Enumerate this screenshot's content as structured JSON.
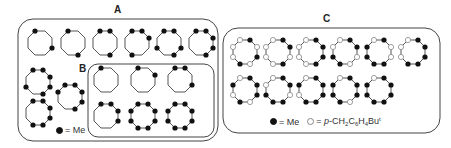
{
  "figure": {
    "panels": [
      {
        "id": "A",
        "label": "A"
      },
      {
        "id": "B",
        "label": "B"
      },
      {
        "id": "C",
        "label": "C"
      }
    ],
    "legend_A": {
      "filled_symbol": "●",
      "filled_text": "= Me"
    },
    "legend_C": {
      "filled_symbol": "●",
      "filled_text": "= Me",
      "open_symbol": "○",
      "open_text_prefix": "= ",
      "open_text_italic": "p",
      "open_text_rest": "-CH",
      "sub1": "2",
      "mid1": "C",
      "sub2": "6",
      "mid2": "H",
      "sub3": "4",
      "mid3": "Bu",
      "sup": "t"
    },
    "colors": {
      "line": "#555555",
      "box": "#444444",
      "filled_dot": "#111111",
      "open_dot_fill": "#ffffff",
      "open_dot_stroke": "#888888"
    },
    "octagons": {
      "A": [
        {
          "cx": 40,
          "cy": 43,
          "pattern": [
            1,
            0,
            0,
            1,
            0,
            0,
            0,
            0
          ]
        },
        {
          "cx": 73,
          "cy": 43,
          "pattern": [
            1,
            0,
            0,
            0,
            1,
            0,
            0,
            0
          ]
        },
        {
          "cx": 105,
          "cy": 43,
          "pattern": [
            1,
            1,
            0,
            0,
            1,
            0,
            0,
            0
          ]
        },
        {
          "cx": 137,
          "cy": 43,
          "pattern": [
            1,
            1,
            1,
            0,
            0,
            1,
            0,
            0
          ]
        },
        {
          "cx": 169,
          "cy": 43,
          "pattern": [
            1,
            1,
            0,
            1,
            1,
            0,
            1,
            0
          ]
        },
        {
          "cx": 201,
          "cy": 43,
          "pattern": [
            1,
            1,
            1,
            1,
            1,
            0,
            0,
            0
          ]
        },
        {
          "cx": 38,
          "cy": 82,
          "pattern": [
            1,
            1,
            1,
            1,
            1,
            0,
            1,
            0
          ]
        },
        {
          "cx": 70,
          "cy": 97,
          "pattern": [
            1,
            1,
            1,
            1,
            1,
            0,
            0,
            1
          ]
        },
        {
          "cx": 38,
          "cy": 113,
          "pattern": [
            1,
            1,
            1,
            1,
            1,
            1,
            0,
            0
          ]
        }
      ],
      "B": [
        {
          "cx": 106,
          "cy": 80,
          "pattern": [
            1,
            0,
            0,
            0,
            0,
            0,
            0,
            0
          ]
        },
        {
          "cx": 143,
          "cy": 80,
          "pattern": [
            1,
            0,
            1,
            0,
            0,
            0,
            0,
            0
          ]
        },
        {
          "cx": 180,
          "cy": 80,
          "pattern": [
            1,
            1,
            0,
            1,
            0,
            0,
            0,
            0
          ]
        },
        {
          "cx": 106,
          "cy": 116,
          "pattern": [
            1,
            1,
            1,
            1,
            0,
            0,
            0,
            0
          ]
        },
        {
          "cx": 143,
          "cy": 116,
          "pattern": [
            1,
            1,
            1,
            1,
            1,
            1,
            1,
            1
          ]
        },
        {
          "cx": 180,
          "cy": 116,
          "pattern": [
            1,
            1,
            1,
            1,
            1,
            1,
            1,
            1
          ]
        }
      ],
      "C": [
        {
          "cx": 245,
          "cy": 52,
          "pattern": [
            2,
            1,
            2,
            1,
            2,
            1,
            2,
            2
          ]
        },
        {
          "cx": 278,
          "cy": 52,
          "pattern": [
            2,
            1,
            1,
            2,
            1,
            2,
            2,
            2
          ]
        },
        {
          "cx": 311,
          "cy": 52,
          "pattern": [
            2,
            1,
            1,
            1,
            1,
            2,
            2,
            2
          ]
        },
        {
          "cx": 345,
          "cy": 52,
          "pattern": [
            2,
            1,
            1,
            2,
            2,
            1,
            1,
            2
          ]
        },
        {
          "cx": 379,
          "cy": 52,
          "pattern": [
            2,
            1,
            2,
            2,
            1,
            1,
            1,
            1
          ]
        },
        {
          "cx": 413,
          "cy": 52,
          "pattern": [
            2,
            1,
            1,
            1,
            1,
            1,
            2,
            2
          ]
        },
        {
          "cx": 245,
          "cy": 90,
          "pattern": [
            2,
            1,
            1,
            1,
            2,
            1,
            2,
            1
          ]
        },
        {
          "cx": 278,
          "cy": 90,
          "pattern": [
            2,
            1,
            1,
            2,
            1,
            1,
            1,
            2
          ]
        },
        {
          "cx": 311,
          "cy": 90,
          "pattern": [
            2,
            1,
            1,
            1,
            1,
            1,
            2,
            1
          ]
        },
        {
          "cx": 345,
          "cy": 90,
          "pattern": [
            2,
            1,
            1,
            1,
            2,
            1,
            1,
            1
          ]
        },
        {
          "cx": 379,
          "cy": 90,
          "pattern": [
            2,
            1,
            1,
            1,
            1,
            1,
            1,
            1
          ]
        }
      ]
    }
  }
}
